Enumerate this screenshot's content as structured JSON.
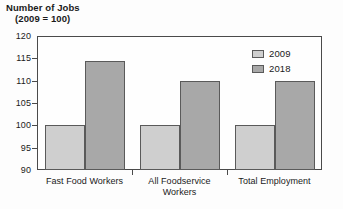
{
  "chart_data": {
    "type": "bar",
    "title": "Number of Jobs",
    "subtitle": "(2009 = 100)",
    "xlabel": "",
    "ylabel": "",
    "ylim": [
      90,
      120
    ],
    "yticks": [
      90,
      95,
      100,
      105,
      110,
      115,
      120
    ],
    "ytick_labels": [
      "90",
      "95",
      "100",
      "105",
      "110",
      "115",
      "120"
    ],
    "grid": false,
    "legend_position": "top-right",
    "categories": [
      "Fast Food Workers",
      "All Foodservice Workers",
      "Total Employment"
    ],
    "category_label_lines": [
      [
        "Fast Food Workers"
      ],
      [
        "All Foodservice",
        "Workers"
      ],
      [
        "Total Employment"
      ]
    ],
    "series": [
      {
        "name": "2009",
        "color": "#cfcfcf",
        "values": [
          100,
          100,
          100
        ]
      },
      {
        "name": "2018",
        "color": "#a8a8a8",
        "values": [
          114.5,
          110,
          110
        ]
      }
    ]
  },
  "legend": {
    "items": [
      {
        "label": "2009"
      },
      {
        "label": "2018"
      }
    ]
  },
  "colors": {
    "series_2009": "#cfcfcf",
    "series_2018": "#a8a8a8",
    "axis": "#4a4a4a",
    "bar_outline": "#5a5a5a",
    "background": "#fdfdfd"
  }
}
